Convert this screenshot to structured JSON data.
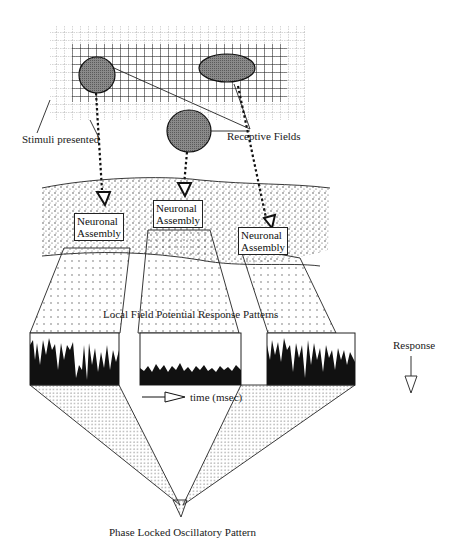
{
  "diagram": {
    "labels": {
      "stimuli": "Stimuli presented",
      "receptive_fields": "Receptive Fields",
      "lfp": "Local Field Potential Response Patterns",
      "time": "time (msec)",
      "response": "Response",
      "phase_locked": "Phase Locked Oscillatory Pattern"
    },
    "assemblies": [
      {
        "line1": "Neuronal",
        "line2": "Assembly"
      },
      {
        "line1": "Neuronal",
        "line2": "Assembly"
      },
      {
        "line1": "Neuronal",
        "line2": "Assembly"
      }
    ],
    "colors": {
      "ink": "#1a1a1a",
      "field_fill": "#6b6b6b",
      "grid": "#222222",
      "stipple": "#555555"
    }
  }
}
